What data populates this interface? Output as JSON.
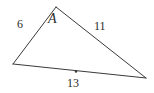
{
  "figure": {
    "kind": "triangle-diagram",
    "background_color": "#ffffff",
    "line_color": "#3a3a3a",
    "text_color": "#2b2b2b",
    "width": 154,
    "height": 93
  },
  "vertices": [
    {
      "name": "A",
      "label": "A",
      "x": 56,
      "y": 7,
      "labeled": true
    },
    {
      "name": "left",
      "label": "",
      "x": 13,
      "y": 64,
      "labeled": false
    },
    {
      "name": "right",
      "label": "",
      "x": 146,
      "y": 78,
      "labeled": false
    }
  ],
  "sides": [
    {
      "name": "left-side",
      "label": "6",
      "from": "A",
      "to": "left",
      "label_x": 17,
      "label_y": 18
    },
    {
      "name": "right-side",
      "label": "11",
      "from": "A",
      "to": "right",
      "label_x": 94,
      "label_y": 20
    },
    {
      "name": "base-side",
      "label": "13",
      "from": "left",
      "to": "right",
      "label_x": 67,
      "label_y": 77
    }
  ],
  "markers": [
    {
      "name": "base-midpoint-dot",
      "x": 76,
      "y": 71.5,
      "r": 1.2
    }
  ]
}
